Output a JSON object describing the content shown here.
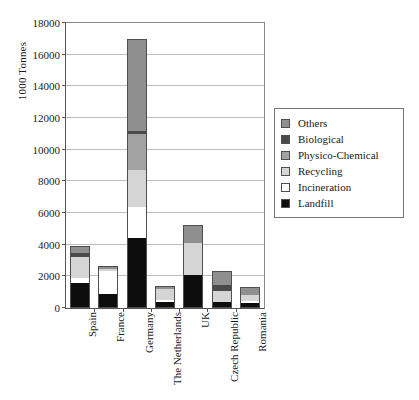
{
  "chart_data": {
    "type": "bar",
    "subtype": "stacked-vertical",
    "title": "",
    "xlabel": "",
    "ylabel": "1000 Tonnes",
    "ylim": [
      0,
      18000
    ],
    "yticks": [
      0,
      2000,
      4000,
      6000,
      8000,
      10000,
      12000,
      14000,
      16000,
      18000
    ],
    "ytick_labels": [
      "0",
      "2000",
      "4000",
      "6000",
      "8000",
      "10000",
      "12000",
      "14000",
      "16000",
      "18000"
    ],
    "grid": true,
    "grid_axis": "y",
    "legend_position": "right",
    "categories": [
      "Spain",
      "France",
      "Germany",
      "The Netherlands",
      "UK",
      "Czech Republic",
      "Romania"
    ],
    "series": [
      {
        "name": "Landfill",
        "color": "#0d0d0d",
        "values": [
          1600,
          900,
          4400,
          350,
          2100,
          400,
          300
        ]
      },
      {
        "name": "Incineration",
        "color": "#ffffff",
        "values": [
          300,
          1450,
          2000,
          150,
          0,
          0,
          120
        ]
      },
      {
        "name": "Recycling",
        "color": "#d5d5d5",
        "values": [
          1350,
          100,
          2300,
          700,
          2000,
          700,
          400
        ]
      },
      {
        "name": "Physico-Chemical",
        "color": "#a3a3a3",
        "values": [
          0,
          0,
          2300,
          0,
          0,
          0,
          0
        ]
      },
      {
        "name": "Biological",
        "color": "#4a4a4a",
        "values": [
          250,
          0,
          200,
          0,
          0,
          350,
          0
        ]
      },
      {
        "name": "Others",
        "color": "#8f8f8f",
        "values": [
          400,
          200,
          5800,
          200,
          1150,
          900,
          530
        ]
      }
    ],
    "totals": [
      3900,
      2650,
      17000,
      1400,
      5250,
      2350,
      1350
    ],
    "series_order_bottom_to_top": [
      "Landfill",
      "Incineration",
      "Recycling",
      "Physico-Chemical",
      "Biological",
      "Others"
    ],
    "legend_entries_top_to_bottom": [
      "Others",
      "Biological",
      "Physico-Chemical",
      "Recycling",
      "Incineration",
      "Landfill"
    ]
  }
}
